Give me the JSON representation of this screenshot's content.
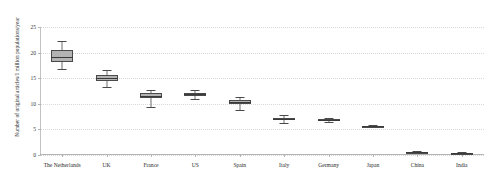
{
  "chart_data": {
    "type": "box",
    "title": "",
    "xlabel": "",
    "ylabel": "Number of original articles/1 million populations/year",
    "ylim": [
      0,
      25
    ],
    "yticks": [
      0,
      5,
      10,
      15,
      20,
      25
    ],
    "ytick_labels": [
      "0",
      "5",
      "10",
      "15",
      "20",
      "25"
    ],
    "grid": true,
    "legend": "none",
    "categories": [
      "The Netherlands",
      "UK",
      "France",
      "US",
      "Spain",
      "Italy",
      "Germany",
      "Japan",
      "China",
      "India"
    ],
    "boxes": [
      {
        "label": "The Netherlands",
        "min": 16.8,
        "q1": 18.2,
        "median": 19.2,
        "q3": 20.6,
        "max": 22.3
      },
      {
        "label": "UK",
        "min": 13.3,
        "q1": 14.4,
        "median": 15.0,
        "q3": 15.7,
        "max": 16.6
      },
      {
        "label": "France",
        "min": 9.3,
        "q1": 11.2,
        "median": 11.6,
        "q3": 12.1,
        "max": 12.6
      },
      {
        "label": "US",
        "min": 11.0,
        "q1": 11.6,
        "median": 11.9,
        "q3": 12.2,
        "max": 12.7
      },
      {
        "label": "Spain",
        "min": 8.7,
        "q1": 9.9,
        "median": 10.3,
        "q3": 10.8,
        "max": 11.3
      },
      {
        "label": "Italy",
        "min": 6.2,
        "q1": 6.8,
        "median": 7.0,
        "q3": 7.3,
        "max": 7.9
      },
      {
        "label": "Germany",
        "min": 6.4,
        "q1": 6.6,
        "median": 6.8,
        "q3": 7.0,
        "max": 7.2
      },
      {
        "label": "Japan",
        "min": 5.4,
        "q1": 5.5,
        "median": 5.6,
        "q3": 5.7,
        "max": 5.8
      },
      {
        "label": "China",
        "min": 0.3,
        "q1": 0.4,
        "median": 0.5,
        "q3": 0.6,
        "max": 0.7
      },
      {
        "label": "India",
        "min": 0.2,
        "q1": 0.3,
        "median": 0.35,
        "q3": 0.4,
        "max": 0.5
      }
    ],
    "colors": {
      "box_fill": "#b3b3b3",
      "box_border": "#4a4a4a",
      "median": "#3a3a3a",
      "whisker": "#6d6d6d",
      "grid": "#d8d8d8",
      "axis": "#b5b5b5",
      "text": "#2b2b2b"
    }
  }
}
